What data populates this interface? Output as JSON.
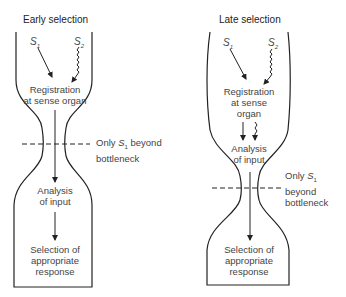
{
  "early": {
    "title": "Early selection",
    "s1": "S",
    "s1_sub": "1",
    "s2": "S",
    "s2_sub": "2",
    "stage1_line1": "Registration",
    "stage1_line2": "at sense organ",
    "note_pre": "Only ",
    "note_s": "S",
    "note_sub": "1",
    "note_post": " beyond",
    "note_line2": "bottleneck",
    "stage2_line1": "Analysis",
    "stage2_line2": "of input",
    "stage3_line1": "Selection of",
    "stage3_line2": "appropriate",
    "stage3_line3": "response"
  },
  "late": {
    "title": "Late selection",
    "s1": "S",
    "s1_sub": "1",
    "s2": "S",
    "s2_sub": "2",
    "stage1_line1": "Registration",
    "stage1_line2": "at sense",
    "stage1_line3": "organ",
    "stage2_line1": "Analysis",
    "stage2_line2": "of input",
    "note_pre": "Only ",
    "note_s": "S",
    "note_sub": "1",
    "note_line2": "beyond",
    "note_line3": "bottleneck",
    "stage3_line1": "Selection of",
    "stage3_line2": "appropriate",
    "stage3_line3": "response"
  }
}
